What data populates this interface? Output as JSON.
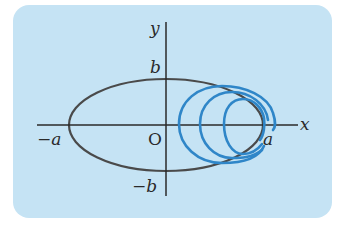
{
  "figure": {
    "background": "#c5e3f4",
    "axes": {
      "x_label": "x",
      "y_label": "y",
      "origin_label": "O",
      "ticks": {
        "pos_a": "a",
        "neg_a": "−a",
        "pos_b": "b",
        "neg_b": "−b"
      }
    },
    "ellipse": {
      "color": "#4a4a4a",
      "semi_major": "a",
      "semi_minor": "b"
    },
    "spiral": {
      "color": "#2f86c8",
      "turns": 3
    }
  }
}
